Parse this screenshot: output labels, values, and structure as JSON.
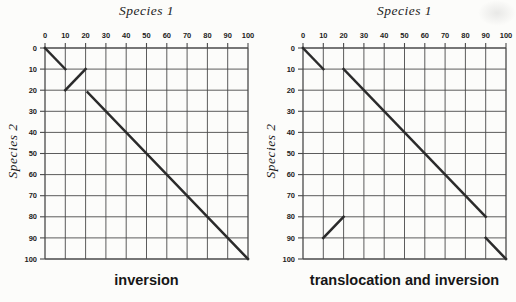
{
  "figure": {
    "background": "#fcfcfa"
  },
  "chart_data": [
    {
      "type": "line",
      "panel": "left",
      "title": "Species 1",
      "xlabel": "Species 1",
      "ylabel": "Species 2",
      "caption": "inversion",
      "xlim": [
        0,
        100
      ],
      "ylim": [
        0,
        100
      ],
      "y_axis_direction": "downward",
      "grid": true,
      "x_ticks": [
        0,
        10,
        20,
        30,
        40,
        50,
        60,
        70,
        80,
        90,
        100
      ],
      "y_ticks": [
        0,
        10,
        20,
        30,
        40,
        50,
        60,
        70,
        80,
        90,
        100
      ],
      "grid_color": "#4a4a4a",
      "segment_color": "#2b2b2b",
      "segments": [
        {
          "name": "diagonal-segment-start",
          "from": [
            0,
            0
          ],
          "to": [
            10,
            10
          ]
        },
        {
          "name": "inverted-segment",
          "from": [
            10,
            20
          ],
          "to": [
            20,
            10
          ]
        },
        {
          "name": "diagonal-segment-end",
          "from": [
            21,
            21
          ],
          "to": [
            100,
            100
          ]
        }
      ]
    },
    {
      "type": "line",
      "panel": "right",
      "title": "Species 1",
      "xlabel": "Species 1",
      "ylabel": "Species 2",
      "caption": "translocation and inversion",
      "xlim": [
        0,
        100
      ],
      "ylim": [
        0,
        100
      ],
      "y_axis_direction": "downward",
      "grid": true,
      "x_ticks": [
        0,
        10,
        20,
        30,
        40,
        50,
        60,
        70,
        80,
        90,
        100
      ],
      "y_ticks": [
        0,
        10,
        20,
        30,
        40,
        50,
        60,
        70,
        80,
        90,
        100
      ],
      "grid_color": "#4a4a4a",
      "segment_color": "#2b2b2b",
      "segments": [
        {
          "name": "diagonal-segment-start",
          "from": [
            0,
            0
          ],
          "to": [
            10,
            10
          ]
        },
        {
          "name": "translocated-diagonal",
          "from": [
            20,
            10
          ],
          "to": [
            90,
            80
          ]
        },
        {
          "name": "translocated-inverted-segment",
          "from": [
            10,
            90
          ],
          "to": [
            20,
            80
          ]
        },
        {
          "name": "diagonal-segment-end",
          "from": [
            90,
            90
          ],
          "to": [
            100,
            100
          ]
        }
      ]
    }
  ]
}
